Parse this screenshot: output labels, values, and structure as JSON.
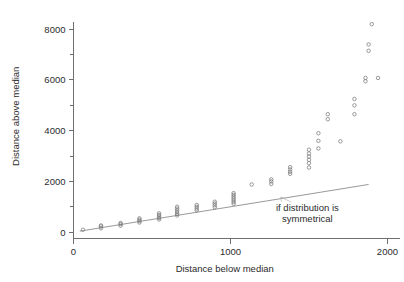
{
  "chart_data": {
    "type": "scatter",
    "title": "",
    "xlabel": "Distance below median",
    "ylabel": "Distance above median",
    "xlim": [
      0,
      2080
    ],
    "ylim": [
      -250,
      8600
    ],
    "xticks": [
      0,
      1000,
      2000
    ],
    "xticklabels": [
      "0",
      "1000",
      "2000"
    ],
    "yticks": [
      0,
      2000,
      4000,
      6000,
      8000
    ],
    "yticklabels": [
      "0",
      "2000",
      "4000",
      "6000",
      "8000"
    ],
    "yminorticks": [
      1000,
      3000,
      5000,
      7000
    ],
    "grid": false,
    "legend_position": "none",
    "marker": "open-circle",
    "reference_line": {
      "label": "if distribution is symmetrical",
      "slope": 1.0,
      "intercept": 0,
      "x_start": 40,
      "x_end": 1880,
      "y_start": 40,
      "y_end": 1880
    },
    "annotations": [
      {
        "text_line_1": "if distribution is",
        "text_line_2": "symmetrical",
        "x": 1490,
        "y": 830,
        "points_to_x": 1320,
        "points_to_y": 1380
      }
    ],
    "points": [
      {
        "x": 60,
        "y": 95
      },
      {
        "x": 175,
        "y": 150
      },
      {
        "x": 175,
        "y": 225
      },
      {
        "x": 175,
        "y": 265
      },
      {
        "x": 300,
        "y": 255
      },
      {
        "x": 300,
        "y": 320
      },
      {
        "x": 300,
        "y": 360
      },
      {
        "x": 420,
        "y": 380
      },
      {
        "x": 420,
        "y": 440
      },
      {
        "x": 420,
        "y": 490
      },
      {
        "x": 420,
        "y": 545
      },
      {
        "x": 545,
        "y": 500
      },
      {
        "x": 545,
        "y": 560
      },
      {
        "x": 545,
        "y": 620
      },
      {
        "x": 545,
        "y": 680
      },
      {
        "x": 545,
        "y": 740
      },
      {
        "x": 660,
        "y": 660
      },
      {
        "x": 660,
        "y": 720
      },
      {
        "x": 660,
        "y": 790
      },
      {
        "x": 660,
        "y": 860
      },
      {
        "x": 660,
        "y": 930
      },
      {
        "x": 660,
        "y": 1000
      },
      {
        "x": 785,
        "y": 860
      },
      {
        "x": 785,
        "y": 930
      },
      {
        "x": 785,
        "y": 1000
      },
      {
        "x": 785,
        "y": 1070
      },
      {
        "x": 900,
        "y": 980
      },
      {
        "x": 900,
        "y": 1060
      },
      {
        "x": 900,
        "y": 1130
      },
      {
        "x": 900,
        "y": 1200
      },
      {
        "x": 1020,
        "y": 1120
      },
      {
        "x": 1020,
        "y": 1190
      },
      {
        "x": 1020,
        "y": 1260
      },
      {
        "x": 1020,
        "y": 1330
      },
      {
        "x": 1020,
        "y": 1400
      },
      {
        "x": 1020,
        "y": 1470
      },
      {
        "x": 1020,
        "y": 1540
      },
      {
        "x": 1135,
        "y": 1880
      },
      {
        "x": 1260,
        "y": 1900
      },
      {
        "x": 1260,
        "y": 2000
      },
      {
        "x": 1260,
        "y": 2080
      },
      {
        "x": 1380,
        "y": 2300
      },
      {
        "x": 1380,
        "y": 2380
      },
      {
        "x": 1380,
        "y": 2470
      },
      {
        "x": 1380,
        "y": 2560
      },
      {
        "x": 1500,
        "y": 2550
      },
      {
        "x": 1500,
        "y": 2720
      },
      {
        "x": 1500,
        "y": 2850
      },
      {
        "x": 1500,
        "y": 2980
      },
      {
        "x": 1500,
        "y": 3100
      },
      {
        "x": 1500,
        "y": 3250
      },
      {
        "x": 1560,
        "y": 3300
      },
      {
        "x": 1560,
        "y": 3600
      },
      {
        "x": 1560,
        "y": 3900
      },
      {
        "x": 1620,
        "y": 4450
      },
      {
        "x": 1620,
        "y": 4650
      },
      {
        "x": 1700,
        "y": 3580
      },
      {
        "x": 1790,
        "y": 4650
      },
      {
        "x": 1790,
        "y": 5000
      },
      {
        "x": 1790,
        "y": 5250
      },
      {
        "x": 1860,
        "y": 5950
      },
      {
        "x": 1860,
        "y": 6080
      },
      {
        "x": 1940,
        "y": 6080
      },
      {
        "x": 1880,
        "y": 7150
      },
      {
        "x": 1880,
        "y": 7400
      },
      {
        "x": 1900,
        "y": 8200
      }
    ]
  }
}
